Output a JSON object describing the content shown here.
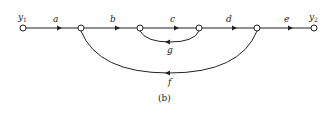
{
  "diagram": {
    "type": "signal-flow-graph",
    "caption": "(b)",
    "nodes": [
      {
        "id": "y1",
        "label": "y",
        "sub": "1"
      },
      {
        "id": "n2",
        "label": ""
      },
      {
        "id": "n3",
        "label": ""
      },
      {
        "id": "n4",
        "label": ""
      },
      {
        "id": "n5",
        "label": ""
      },
      {
        "id": "y2",
        "label": "y",
        "sub": "2"
      }
    ],
    "edges": [
      {
        "from": "y1",
        "to": "n2",
        "label": "a"
      },
      {
        "from": "n2",
        "to": "n3",
        "label": "b"
      },
      {
        "from": "n3",
        "to": "n4",
        "label": "c"
      },
      {
        "from": "n4",
        "to": "n5",
        "label": "d"
      },
      {
        "from": "n5",
        "to": "y2",
        "label": "e"
      },
      {
        "from": "n4",
        "to": "n3",
        "label": "g",
        "kind": "feedback"
      },
      {
        "from": "n5",
        "to": "n2",
        "label": "f",
        "kind": "feedback"
      }
    ]
  }
}
